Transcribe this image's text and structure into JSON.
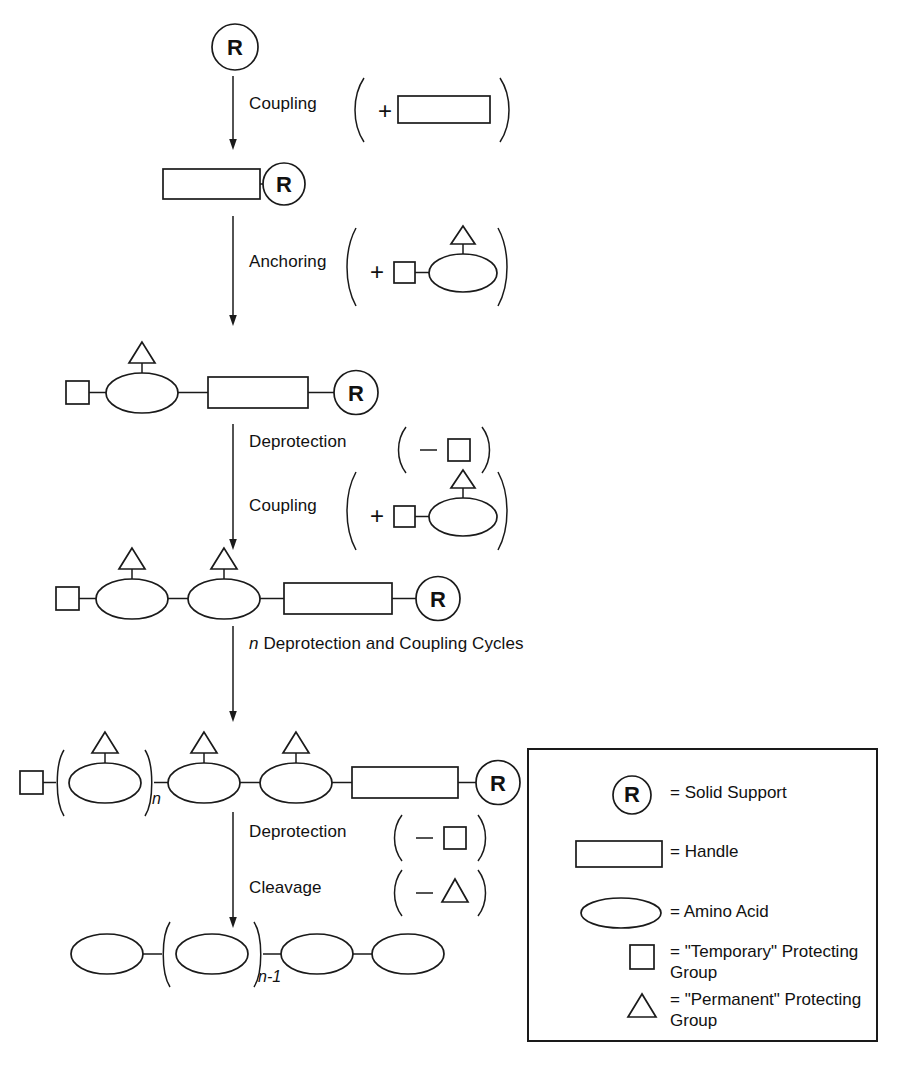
{
  "diagram": {
    "steps": [
      {
        "id": "coupling-1",
        "label": "Coupling"
      },
      {
        "id": "anchoring",
        "label": "Anchoring"
      },
      {
        "id": "deprotection-1",
        "label": "Deprotection"
      },
      {
        "id": "coupling-2",
        "label": "Coupling"
      },
      {
        "id": "cycles",
        "label_prefix": "n",
        "label_rest": " Deprotection and Coupling Cycles"
      },
      {
        "id": "deprotection-2",
        "label": "Deprotection"
      },
      {
        "id": "cleavage",
        "label": "Cleavage"
      }
    ],
    "reagents": {
      "plus": "+",
      "minus": "–",
      "paren_open": "(",
      "paren_close": ")"
    },
    "subscripts": {
      "n": "n",
      "n_minus_1": "n-1"
    },
    "solid_support_glyph": "R"
  },
  "legend": {
    "items": [
      {
        "icon": "solid-support-circle",
        "glyph": "R",
        "text": "= Solid Support"
      },
      {
        "icon": "handle-rectangle",
        "glyph": "",
        "text": "= Handle"
      },
      {
        "icon": "amino-acid-ellipse",
        "glyph": "",
        "text": "= Amino Acid"
      },
      {
        "icon": "temporary-protecting-square",
        "glyph": "",
        "text": "= \"Temporary\" Protecting\n    Group"
      },
      {
        "icon": "permanent-protecting-triangle",
        "glyph": "",
        "text": "= \"Permanent\" Protecting\n    Group"
      }
    ]
  },
  "colors": {
    "ink": "#1a1a1a",
    "background": "#ffffff"
  }
}
